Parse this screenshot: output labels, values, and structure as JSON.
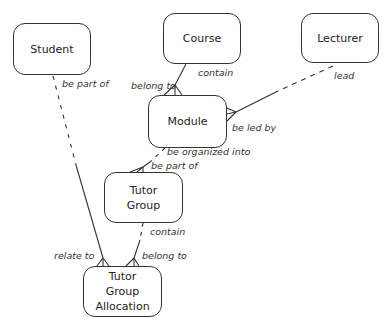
{
  "diagram": {
    "type": "entity-relationship",
    "entities": [
      {
        "id": "student",
        "label": "Student"
      },
      {
        "id": "course",
        "label": "Course"
      },
      {
        "id": "lecturer",
        "label": "Lecturer"
      },
      {
        "id": "module",
        "label": "Module"
      },
      {
        "id": "tutor_group",
        "label": "Tutor Group",
        "lines": [
          "Tutor",
          "Group"
        ]
      },
      {
        "id": "tutor_group_allocation",
        "label": "Tutor Group Allocation",
        "lines": [
          "Tutor",
          "Group",
          "Allocation"
        ]
      }
    ],
    "relationships": [
      {
        "from": "course",
        "to": "module",
        "from_label": "contain",
        "to_label": "belong to",
        "style": "solid",
        "many_end": "module"
      },
      {
        "from": "lecturer",
        "to": "module",
        "from_label": "lead",
        "to_label": "be led by",
        "style": "dashed-solid",
        "many_end": "module"
      },
      {
        "from": "module",
        "to": "tutor_group",
        "from_label": "be organized into",
        "to_label": "be part of",
        "style": "dashed-solid",
        "many_end": "tutor_group"
      },
      {
        "from": "student",
        "to": "tutor_group_allocation",
        "from_label": "be part of",
        "to_label": "relate to",
        "style": "dashed-solid",
        "many_end": "tutor_group_allocation"
      },
      {
        "from": "tutor_group",
        "to": "tutor_group_allocation",
        "from_label": "contain",
        "to_label": "belong to",
        "style": "dashed-solid",
        "many_end": "tutor_group_allocation"
      }
    ]
  },
  "labels": {
    "student": "Student",
    "course": "Course",
    "lecturer": "Lecturer",
    "module": "Module",
    "tutor_group_l1": "Tutor",
    "tutor_group_l2": "Group",
    "tga_l1": "Tutor",
    "tga_l2": "Group",
    "tga_l3": "Allocation",
    "rel_student_be_part_of": "be part of",
    "rel_course_contain": "contain",
    "rel_module_belong_to": "belong to",
    "rel_lecturer_lead": "lead",
    "rel_module_be_led_by": "be led by",
    "rel_module_be_organized_into": "be organized into",
    "rel_tg_be_part_of": "be part of",
    "rel_tg_contain": "contain",
    "rel_tga_relate_to": "relate to",
    "rel_tga_belong_to": "belong to"
  },
  "colors": {
    "line": "#333333",
    "background": "#ffffff"
  }
}
